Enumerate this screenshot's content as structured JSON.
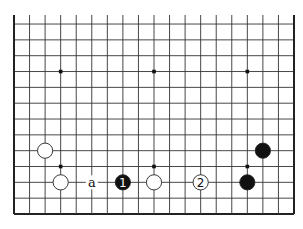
{
  "diagram": {
    "type": "go-board-fragment",
    "columns": 19,
    "visible_rows": 13,
    "edges": {
      "left": true,
      "right": true,
      "bottom": true,
      "top": false
    },
    "star_points": [
      [
        3,
        3
      ],
      [
        9,
        3
      ],
      [
        15,
        3
      ],
      [
        3,
        9
      ],
      [
        9,
        9
      ],
      [
        15,
        9
      ]
    ],
    "stones": [
      {
        "color": "white",
        "col": 2,
        "row": 8,
        "label": ""
      },
      {
        "color": "white",
        "col": 3,
        "row": 10,
        "label": ""
      },
      {
        "color": "black",
        "col": 7,
        "row": 10,
        "label": "1"
      },
      {
        "color": "white",
        "col": 9,
        "row": 10,
        "label": ""
      },
      {
        "color": "white",
        "col": 12,
        "row": 10,
        "label": "2"
      },
      {
        "color": "black",
        "col": 15,
        "row": 10,
        "label": ""
      },
      {
        "color": "black",
        "col": 16,
        "row": 8,
        "label": ""
      }
    ],
    "markers": [
      {
        "col": 5,
        "row": 10,
        "label": "a"
      }
    ],
    "colors": {
      "line": "#333333",
      "edge": "#222222",
      "black_stone": "#111111",
      "white_stone": "#ffffff",
      "stone_outline": "#222222"
    }
  }
}
